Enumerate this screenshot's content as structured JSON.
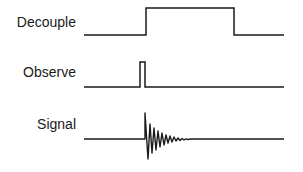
{
  "diagram": {
    "channels": [
      {
        "label": "Decouple",
        "type": "square-pulse"
      },
      {
        "label": "Observe",
        "type": "narrow-pulse"
      },
      {
        "label": "Signal",
        "type": "damped-oscillation"
      }
    ],
    "colors": {
      "line": "#1a1a1a",
      "background": "#ffffff"
    }
  }
}
